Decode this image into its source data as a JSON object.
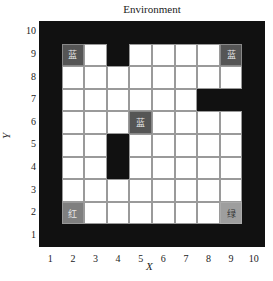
{
  "title": "Environment",
  "axes": {
    "xlabel": "X",
    "ylabel": "Y",
    "xticks": [
      "1",
      "2",
      "3",
      "4",
      "5",
      "6",
      "7",
      "8",
      "9",
      "10"
    ],
    "yticks": [
      "10",
      "9",
      "8",
      "7",
      "6",
      "5",
      "4",
      "3",
      "2",
      "1"
    ]
  },
  "legend_colors": {
    "wall": "#111111",
    "empty": "#ffffff",
    "blue": "#555555",
    "red": "#7f7f7f",
    "green": "#9e9e9e"
  },
  "grid": {
    "size": [
      10,
      10
    ],
    "walls": [
      {
        "x": 4,
        "y": 9
      },
      {
        "x": 4,
        "y": 5
      },
      {
        "x": 4,
        "y": 4
      },
      {
        "x": 8,
        "y": 7
      },
      {
        "x": 9,
        "y": 7
      }
    ],
    "border": "all cells with x=1, x=10, y=1 or y=10 are walls",
    "markers": [
      {
        "x": 2,
        "y": 9,
        "type": "blue",
        "label": "蓝"
      },
      {
        "x": 9,
        "y": 9,
        "type": "blue",
        "label": "蓝"
      },
      {
        "x": 5,
        "y": 6,
        "type": "blue",
        "label": "蓝"
      },
      {
        "x": 2,
        "y": 2,
        "type": "red",
        "label": "红"
      },
      {
        "x": 9,
        "y": 2,
        "type": "green",
        "label": "绿"
      }
    ]
  }
}
